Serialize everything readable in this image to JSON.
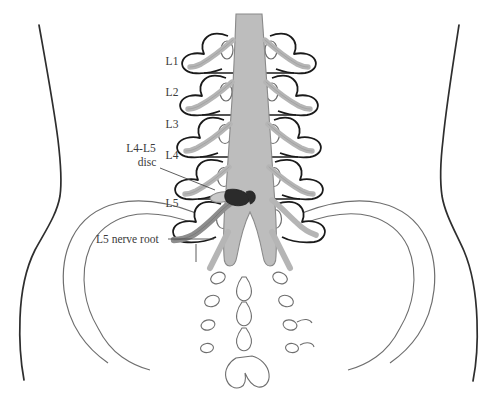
{
  "figure": {
    "background_color": "#ffffff",
    "width": 498,
    "height": 397
  },
  "colors": {
    "outline": "#6e6e6e",
    "body_outline": "#2e2e2e",
    "bone_outline": "#1a1a1a",
    "cord_fill": "#bdbdbd",
    "cord_stroke": "#8a8a8a",
    "nerve_fill": "#b5b5b5",
    "nerve_stroke": "#8a8a8a",
    "affected_nerve_fill": "#8d8d8d",
    "affected_nerve_stroke": "#6b6b6b",
    "herniation_fill": "#2b2b2b",
    "disc_fill": "#c9c9c9",
    "label_text": "#3a3a3a",
    "leader_line": "#4a4a4a"
  },
  "vertebra_labels": [
    {
      "id": "l1",
      "text": "L1",
      "x": 172,
      "y": 65
    },
    {
      "id": "l2",
      "text": "L2",
      "x": 172,
      "y": 96
    },
    {
      "id": "l3",
      "text": "L3",
      "x": 172,
      "y": 128
    },
    {
      "id": "l4",
      "text": "L4",
      "x": 172,
      "y": 159
    },
    {
      "id": "l5",
      "text": "L5",
      "x": 172,
      "y": 207
    }
  ],
  "annotations": [
    {
      "id": "disc",
      "line1": "L4-L5",
      "line2": "disc",
      "line1_x": 141,
      "line1_y": 152,
      "line2_x": 147,
      "line2_y": 166,
      "leader": "M 160 168 L 215 190"
    },
    {
      "id": "nerve-root",
      "line1": "L5 nerve root",
      "line1_x": 96,
      "line1_y": 243,
      "leader": "M 168 239 L 214 239"
    }
  ],
  "structures": {
    "spinal_cord": "central cauda equina / thecal sac",
    "vertebrae": [
      "L1",
      "L2",
      "L3",
      "L4",
      "L5"
    ],
    "pelvis": [
      "left iliac wing",
      "right iliac wing"
    ],
    "sacrum": "sacral segments with foramina",
    "coccyx": "coccyx",
    "pathology": "posterolateral disc herniation at L4-L5 compressing left L5 nerve root"
  }
}
